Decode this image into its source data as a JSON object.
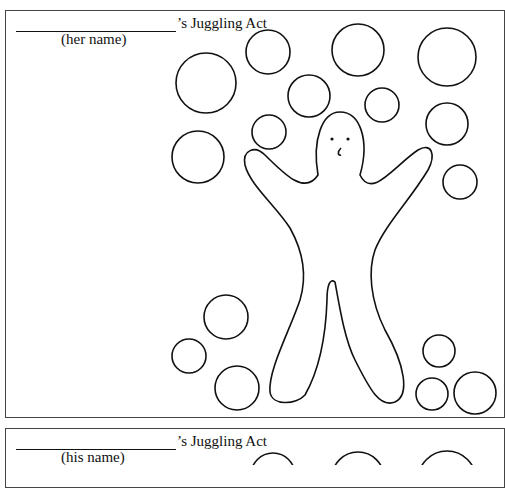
{
  "worksheets": [
    {
      "title_suffix": "’s Juggling Act",
      "name_label": "(her name)",
      "balls": [
        {
          "cx": 268,
          "cy": 52,
          "r": 22
        },
        {
          "cx": 358,
          "cy": 50,
          "r": 26
        },
        {
          "cx": 447,
          "cy": 57,
          "r": 29
        },
        {
          "cx": 206,
          "cy": 83,
          "r": 30
        },
        {
          "cx": 309,
          "cy": 96,
          "r": 21
        },
        {
          "cx": 382,
          "cy": 105,
          "r": 17
        },
        {
          "cx": 269,
          "cy": 132,
          "r": 17
        },
        {
          "cx": 447,
          "cy": 124,
          "r": 21
        },
        {
          "cx": 198,
          "cy": 157,
          "r": 26
        },
        {
          "cx": 460,
          "cy": 182,
          "r": 17
        },
        {
          "cx": 226,
          "cy": 317,
          "r": 22
        },
        {
          "cx": 189,
          "cy": 356,
          "r": 17
        },
        {
          "cx": 237,
          "cy": 388,
          "r": 22
        },
        {
          "cx": 439,
          "cy": 351,
          "r": 16
        },
        {
          "cx": 432,
          "cy": 394,
          "r": 16
        },
        {
          "cx": 475,
          "cy": 393,
          "r": 21
        }
      ]
    },
    {
      "title_suffix": "’s Juggling Act",
      "name_label": "(his name)",
      "balls": [
        {
          "cx": 273,
          "cy": 475,
          "r": 22
        },
        {
          "cx": 358,
          "cy": 478,
          "r": 26
        },
        {
          "cx": 447,
          "cy": 480,
          "r": 29
        }
      ]
    }
  ]
}
